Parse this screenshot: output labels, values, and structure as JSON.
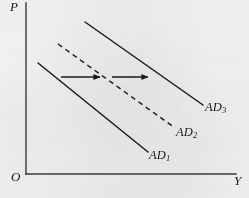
{
  "figure": {
    "kind": "economics-line-diagram",
    "background_color": "#f7f6f4",
    "ink_color": "#1a1a1a"
  },
  "axes": {
    "y_axis_label": "P",
    "x_axis_label": "Y",
    "origin_label": "O",
    "y_axis": {
      "x": 26,
      "y_top": 3,
      "y_bottom": 174
    },
    "x_axis": {
      "y": 174,
      "x_left": 26,
      "x_right": 236
    }
  },
  "curves": [
    {
      "name": "AD1",
      "label_text": "AD",
      "label_sub": "1",
      "style": "solid",
      "color": "#1a1a1a",
      "x1": 38,
      "y1": 63,
      "x2": 148,
      "y2": 152
    },
    {
      "name": "AD2",
      "label_text": "AD",
      "label_sub": "2",
      "style": "dashed",
      "color": "#1a1a1a",
      "x1": 58,
      "y1": 44,
      "x2": 175,
      "y2": 128
    },
    {
      "name": "AD3",
      "label_text": "AD",
      "label_sub": "3",
      "style": "solid",
      "color": "#1a1a1a",
      "x1": 85,
      "y1": 22,
      "x2": 203,
      "y2": 105
    }
  ],
  "shift_arrows": [
    {
      "name": "shift-arrow-1",
      "x1": 61,
      "y1": 77,
      "x2": 104,
      "y2": 77
    },
    {
      "name": "shift-arrow-2",
      "x1": 112,
      "y1": 77,
      "x2": 152,
      "y2": 77
    }
  ],
  "chart_data": {
    "type": "line",
    "title": "",
    "xlabel": "Y",
    "ylabel": "P",
    "grid": false,
    "legend": "inline-curve-labels",
    "annotations": [
      "rightward shift arrows between AD1 and AD2 and between AD2 and AD3"
    ],
    "series": [
      {
        "name": "AD1",
        "style": "solid",
        "points": [
          [
            38,
            63
          ],
          [
            148,
            152
          ]
        ]
      },
      {
        "name": "AD2",
        "style": "dashed",
        "points": [
          [
            58,
            44
          ],
          [
            175,
            128
          ]
        ]
      },
      {
        "name": "AD3",
        "style": "solid",
        "points": [
          [
            85,
            22
          ],
          [
            203,
            105
          ]
        ]
      }
    ]
  }
}
